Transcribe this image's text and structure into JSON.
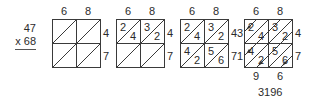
{
  "problem": {
    "multiplicand": "47",
    "multiplier_line": "x 68"
  },
  "panels": [
    {
      "step": 1,
      "top_labels": [
        "6",
        "8"
      ],
      "right_labels": [
        "4",
        "7"
      ],
      "cells": [
        [
          "",
          "",
          "",
          ""
        ],
        [
          "",
          "",
          "",
          ""
        ]
      ]
    },
    {
      "step": 2,
      "top_labels": [
        "6",
        "8"
      ],
      "right_labels": [
        "4",
        "7"
      ],
      "cells": [
        [
          {
            "tens": "2",
            "ones": "4"
          },
          {
            "tens": "3",
            "ones": "2"
          }
        ],
        [
          {
            "tens": "",
            "ones": ""
          },
          {
            "tens": "",
            "ones": ""
          }
        ]
      ]
    },
    {
      "step": 3,
      "top_labels": [
        "6",
        "8"
      ],
      "right_labels": [
        "4",
        "7"
      ],
      "cells": [
        [
          {
            "tens": "2",
            "ones": "4"
          },
          {
            "tens": "3",
            "ones": "2"
          }
        ],
        [
          {
            "tens": "4",
            "ones": "2"
          },
          {
            "tens": "5",
            "ones": "6"
          }
        ]
      ]
    },
    {
      "step": 4,
      "top_labels": [
        "6",
        "8"
      ],
      "left_labels": [
        "3",
        "1"
      ],
      "right_labels": [
        "4",
        "7"
      ],
      "cells": [
        [
          {
            "tens": "2",
            "ones": "4"
          },
          {
            "tens": "3",
            "ones": "2"
          }
        ],
        [
          {
            "tens": "4",
            "ones": "2"
          },
          {
            "tens": "5",
            "ones": "6"
          }
        ]
      ],
      "bottom_labels": [
        "9",
        "6"
      ],
      "result": "3196"
    }
  ],
  "colors": {
    "line": "#3a3a3a",
    "text": "#2b2b2b",
    "background": "#ffffff"
  }
}
